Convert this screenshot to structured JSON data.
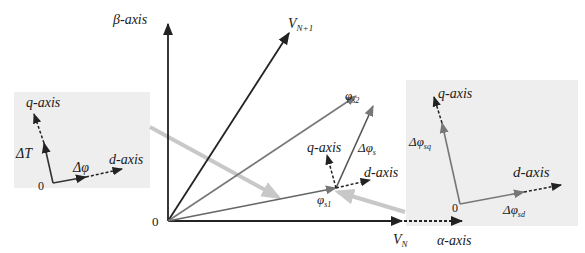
{
  "colors": {
    "background": "#ffffff",
    "inset_background": "#eeeeee",
    "dark_vector": "#222222",
    "gray_vector": "#777777",
    "highlight_arrow": "#c8c8c8"
  },
  "main": {
    "origin_label": "0",
    "beta_axis_label": "β-axis",
    "alpha_axis_label": "α-axis",
    "vn_label": "V",
    "vn_sub": "N",
    "vn1_label": "V",
    "vn1_sub": "N+1",
    "phi_s1_label": "φ",
    "phi_s1_sub": "s1",
    "phi_s2_label": "φ",
    "phi_s2_sub": "s2",
    "delta_phi_s_label": "Δφ",
    "delta_phi_s_sub": "s",
    "local_q_label": "q-axis",
    "local_d_label": "d-axis"
  },
  "left_inset": {
    "q_axis_label": "q-axis",
    "d_axis_label": "d-axis",
    "origin_label": "0",
    "delta_t_label": "ΔT",
    "delta_phi_label": "Δφ"
  },
  "right_inset": {
    "q_axis_label": "q-axis",
    "d_axis_label": "d-axis",
    "origin_label": "0",
    "delta_phi_sq_label": "Δφ",
    "delta_phi_sq_sub": "sq",
    "delta_phi_sd_label": "Δφ",
    "delta_phi_sd_sub": "sd"
  }
}
